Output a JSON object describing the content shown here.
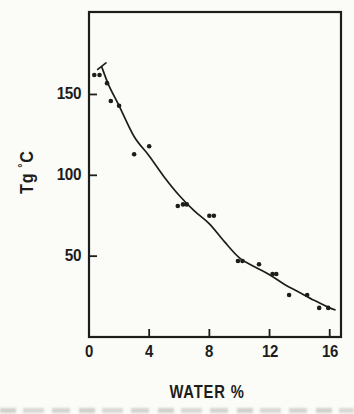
{
  "figure": {
    "bg": "#fbfbf8",
    "ink": "#1d1d1b"
  },
  "chart_data": {
    "type": "scatter",
    "title": "",
    "xlabel": "WATER %",
    "ylabel": "Tg °C",
    "ylabel_parts": {
      "main": "Tg",
      "degree": "°",
      "unit": "C"
    },
    "xlim": [
      0,
      16.75
    ],
    "ylim": [
      0,
      201
    ],
    "x_ticks": [
      0,
      4,
      8,
      12,
      16
    ],
    "y_ticks": [
      50,
      100,
      150
    ],
    "grid": false,
    "legend": false,
    "series": [
      {
        "name": "glass transition temperature data points",
        "type": "scatter",
        "points": [
          [
            0.35,
            162
          ],
          [
            0.7,
            162
          ],
          [
            1.2,
            157
          ],
          [
            1.45,
            146
          ],
          [
            2.0,
            143
          ],
          [
            3.0,
            113
          ],
          [
            4.0,
            118
          ],
          [
            5.9,
            81
          ],
          [
            6.25,
            82
          ],
          [
            6.5,
            82
          ],
          [
            8.0,
            75
          ],
          [
            8.3,
            75
          ],
          [
            9.9,
            47
          ],
          [
            10.2,
            47
          ],
          [
            11.3,
            45
          ],
          [
            12.2,
            39
          ],
          [
            12.45,
            39
          ],
          [
            13.3,
            26
          ],
          [
            14.5,
            26
          ],
          [
            15.3,
            18
          ],
          [
            15.9,
            18
          ]
        ]
      },
      {
        "name": "fitted curve",
        "type": "line",
        "points": [
          [
            0.85,
            167
          ],
          [
            1.3,
            156
          ],
          [
            2,
            143
          ],
          [
            3,
            124
          ],
          [
            4,
            112
          ],
          [
            5,
            99
          ],
          [
            6,
            87.5
          ],
          [
            7,
            78
          ],
          [
            8,
            70
          ],
          [
            9,
            59
          ],
          [
            10,
            49
          ],
          [
            11,
            43.5
          ],
          [
            12,
            38.5
          ],
          [
            13,
            32.5
          ],
          [
            14,
            27.5
          ],
          [
            15,
            22.5
          ],
          [
            16,
            18
          ],
          [
            16.35,
            16.8
          ]
        ]
      },
      {
        "name": "curve start cap dash",
        "type": "line",
        "points": [
          [
            0.58,
            165.5
          ],
          [
            1.13,
            169.5
          ]
        ]
      }
    ]
  }
}
